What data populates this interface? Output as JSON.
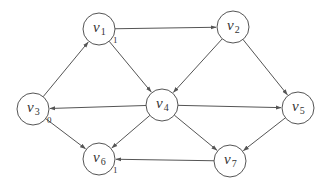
{
  "diagram": {
    "type": "directed-graph",
    "nodes": [
      {
        "id": "v1",
        "name": "v",
        "sub": "1",
        "x": 99,
        "y": 29,
        "tag": "1"
      },
      {
        "id": "v2",
        "name": "v",
        "sub": "2",
        "x": 233,
        "y": 27,
        "tag": ""
      },
      {
        "id": "v3",
        "name": "v",
        "sub": "3",
        "x": 33,
        "y": 109,
        "tag": "0"
      },
      {
        "id": "v4",
        "name": "v",
        "sub": "4",
        "x": 162,
        "y": 105,
        "tag": ""
      },
      {
        "id": "v5",
        "name": "v",
        "sub": "5",
        "x": 298,
        "y": 108,
        "tag": ""
      },
      {
        "id": "v6",
        "name": "v",
        "sub": "6",
        "x": 99,
        "y": 159,
        "tag": "1"
      },
      {
        "id": "v7",
        "name": "v",
        "sub": "7",
        "x": 230,
        "y": 161,
        "tag": ""
      }
    ],
    "edges": [
      {
        "from": "v1",
        "to": "v2"
      },
      {
        "from": "v1",
        "to": "v4"
      },
      {
        "from": "v3",
        "to": "v1"
      },
      {
        "from": "v4",
        "to": "v3"
      },
      {
        "from": "v2",
        "to": "v4"
      },
      {
        "from": "v2",
        "to": "v5"
      },
      {
        "from": "v4",
        "to": "v5"
      },
      {
        "from": "v3",
        "to": "v6"
      },
      {
        "from": "v4",
        "to": "v6"
      },
      {
        "from": "v4",
        "to": "v7"
      },
      {
        "from": "v5",
        "to": "v7"
      },
      {
        "from": "v7",
        "to": "v6"
      }
    ],
    "node_radius": 16,
    "colors": {
      "stroke": "#555555",
      "text": "#333333",
      "background": "#ffffff"
    }
  }
}
